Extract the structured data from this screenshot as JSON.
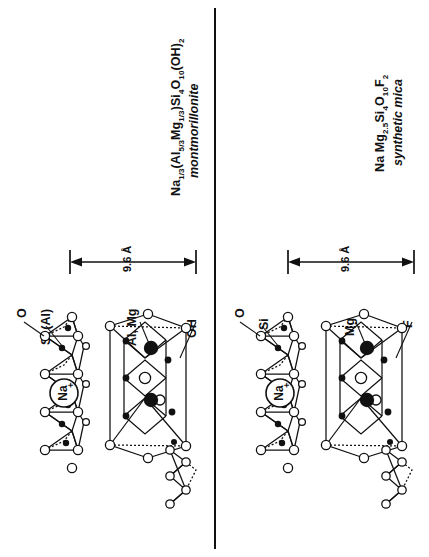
{
  "figure": {
    "orientation": "rotated-90",
    "panel_count": 2,
    "ink_color": "#111111",
    "background_color": "#ffffff"
  },
  "panels": [
    {
      "id": "montmorillonite",
      "formula": "Na1/3(Al5/3Mg1/3)Si4O10(OH)2",
      "formula_parts": [
        {
          "t": "Na",
          "sub": "1/3"
        },
        {
          "t": "(Al",
          "sub": "5/3"
        },
        {
          "t": "Mg",
          "sub": "1/3"
        },
        {
          "t": ")Si",
          "sub": "4"
        },
        {
          "t": "O",
          "sub": "10"
        },
        {
          "t": "(OH)",
          "sub": "2"
        }
      ],
      "mineral_name": "montmorillonite",
      "spacing_label": "9.6 Å",
      "interlayer_cation": "Na",
      "interlayer_charge": "+",
      "atom_labels": [
        "O",
        "Si (Al)",
        "Al, Mg",
        "OH"
      ]
    },
    {
      "id": "synthetic-mica",
      "formula": "Na Mg2.5Si4O10F2",
      "formula_parts": [
        {
          "t": "Na Mg",
          "sub": "2.5"
        },
        {
          "t": "Si",
          "sub": "4"
        },
        {
          "t": "O",
          "sub": "10"
        },
        {
          "t": "F",
          "sub": "2"
        }
      ],
      "mineral_name": "synthetic mica",
      "spacing_label": "9.6 Å",
      "interlayer_cation": "Na",
      "interlayer_charge": "+",
      "atom_labels": [
        "O",
        "Si",
        "Mg",
        "F"
      ]
    }
  ]
}
